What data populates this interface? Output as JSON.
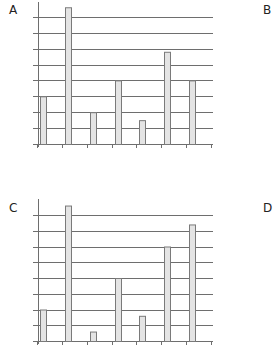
{
  "panels": [
    {
      "label": "A"
    },
    {
      "label": "B"
    },
    {
      "label": "C"
    },
    {
      "label": "D"
    }
  ],
  "colors": {
    "bar_fill": "#e4e4e4",
    "bar_stroke": "#7a7a7a",
    "grid": "#6e6e6e",
    "axis": "#6e6e6e",
    "text": "#222222"
  },
  "chart_data": [
    {
      "panel": "A",
      "type": "bar",
      "title": "",
      "xlabel": "",
      "ylabel": "",
      "categories": [
        "1",
        "2",
        "3",
        "4",
        "5",
        "6",
        "7"
      ],
      "values": [
        3,
        8.6,
        2,
        4,
        1.5,
        5.8,
        4
      ],
      "ylim": [
        0,
        8.8
      ],
      "grid": true,
      "gridlines": 8,
      "tick_labels_shown": false,
      "legend": null
    },
    {
      "panel": "C",
      "type": "bar",
      "title": "",
      "xlabel": "",
      "ylabel": "",
      "categories": [
        "1",
        "2",
        "3",
        "4",
        "5",
        "6",
        "7"
      ],
      "values": [
        2,
        8.6,
        0.6,
        4,
        1.6,
        6,
        7.4
      ],
      "ylim": [
        0,
        8.8
      ],
      "grid": true,
      "gridlines": 8,
      "tick_labels_shown": false,
      "legend": null
    }
  ]
}
